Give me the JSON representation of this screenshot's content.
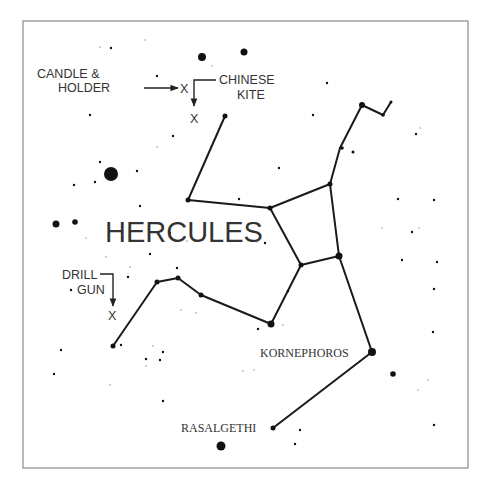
{
  "diagram": {
    "title": "HERCULES",
    "frame": {
      "x": 23,
      "y": 21,
      "w": 445,
      "h": 447
    },
    "colors": {
      "ink": "#111111",
      "label": "#333333",
      "frame": "#8a8a8a"
    },
    "labels": {
      "candle_line1": "CANDLE &",
      "candle_line2": "HOLDER",
      "chinese_line1": "CHINESE",
      "chinese_line2": "KITE",
      "drill_line1": "DRILL",
      "drill_line2": "GUN",
      "kornephoros": "KORNEPHOROS",
      "rasalgethi": "RASALGETHI",
      "marker": "X"
    },
    "named_stars": [
      {
        "name": "KORNEPHOROS",
        "x": 372,
        "y": 352,
        "r": 4
      },
      {
        "name": "RASALGETHI",
        "x": 273,
        "y": 428,
        "r": 2.5
      }
    ],
    "constellation_lines": [
      [
        [
          225,
          116
        ],
        [
          188,
          200
        ]
      ],
      [
        [
          188,
          200
        ],
        [
          270,
          208
        ]
      ],
      [
        [
          270,
          208
        ],
        [
          330,
          184
        ]
      ],
      [
        [
          330,
          184
        ],
        [
          340,
          148
        ]
      ],
      [
        [
          340,
          148
        ],
        [
          362,
          105
        ]
      ],
      [
        [
          362,
          105
        ],
        [
          383,
          115
        ]
      ],
      [
        [
          383,
          115
        ],
        [
          391,
          102
        ]
      ],
      [
        [
          270,
          208
        ],
        [
          301,
          265
        ]
      ],
      [
        [
          330,
          184
        ],
        [
          339,
          256
        ]
      ],
      [
        [
          301,
          265
        ],
        [
          339,
          256
        ]
      ],
      [
        [
          301,
          265
        ],
        [
          271,
          324
        ]
      ],
      [
        [
          271,
          324
        ],
        [
          201,
          295
        ]
      ],
      [
        [
          201,
          295
        ],
        [
          178,
          278
        ]
      ],
      [
        [
          178,
          278
        ],
        [
          157,
          282
        ]
      ],
      [
        [
          157,
          282
        ],
        [
          113,
          346
        ]
      ],
      [
        [
          339,
          256
        ],
        [
          372,
          352
        ]
      ],
      [
        [
          372,
          352
        ],
        [
          273,
          428
        ]
      ]
    ],
    "stars": [
      {
        "x": 225,
        "y": 116,
        "r": 2.5
      },
      {
        "x": 188,
        "y": 200,
        "r": 2.5
      },
      {
        "x": 270,
        "y": 208,
        "r": 2.5
      },
      {
        "x": 330,
        "y": 184,
        "r": 2.5
      },
      {
        "x": 342,
        "y": 148,
        "r": 1.8
      },
      {
        "x": 362,
        "y": 105,
        "r": 3
      },
      {
        "x": 383,
        "y": 115,
        "r": 1.8
      },
      {
        "x": 391,
        "y": 102,
        "r": 1.5
      },
      {
        "x": 301,
        "y": 265,
        "r": 2.5
      },
      {
        "x": 339,
        "y": 256,
        "r": 3.5
      },
      {
        "x": 271,
        "y": 324,
        "r": 3.5
      },
      {
        "x": 201,
        "y": 295,
        "r": 2.5
      },
      {
        "x": 178,
        "y": 278,
        "r": 2.5
      },
      {
        "x": 157,
        "y": 282,
        "r": 2.5
      },
      {
        "x": 113,
        "y": 346,
        "r": 2.5
      },
      {
        "x": 202,
        "y": 57,
        "r": 4
      },
      {
        "x": 244,
        "y": 52,
        "r": 3.5
      },
      {
        "x": 111,
        "y": 174,
        "r": 7
      },
      {
        "x": 56,
        "y": 224,
        "r": 3.5
      },
      {
        "x": 75,
        "y": 222,
        "r": 2.8
      },
      {
        "x": 222,
        "y": 492,
        "r": 0
      },
      {
        "x": 221,
        "y": 446,
        "r": 4.5
      },
      {
        "x": 393,
        "y": 374,
        "r": 2.8
      },
      {
        "x": 111,
        "y": 48,
        "r": 1.2
      },
      {
        "x": 157,
        "y": 76,
        "r": 1.2
      },
      {
        "x": 90,
        "y": 115,
        "r": 1.2
      },
      {
        "x": 173,
        "y": 136,
        "r": 1.2
      },
      {
        "x": 100,
        "y": 162,
        "r": 1.2
      },
      {
        "x": 95,
        "y": 182,
        "r": 1.2
      },
      {
        "x": 74,
        "y": 185,
        "r": 1.2
      },
      {
        "x": 137,
        "y": 171,
        "r": 1.2
      },
      {
        "x": 140,
        "y": 206,
        "r": 1.2
      },
      {
        "x": 150,
        "y": 254,
        "r": 1.2
      },
      {
        "x": 128,
        "y": 277,
        "r": 1.2
      },
      {
        "x": 71,
        "y": 290,
        "r": 1.2
      },
      {
        "x": 177,
        "y": 268,
        "r": 1.2
      },
      {
        "x": 121,
        "y": 345,
        "r": 1.2
      },
      {
        "x": 61,
        "y": 350,
        "r": 1.2
      },
      {
        "x": 54,
        "y": 374,
        "r": 1.2
      },
      {
        "x": 146,
        "y": 359,
        "r": 1.2
      },
      {
        "x": 163,
        "y": 352,
        "r": 1.2
      },
      {
        "x": 160,
        "y": 360,
        "r": 1.2
      },
      {
        "x": 163,
        "y": 401,
        "r": 1.2
      },
      {
        "x": 327,
        "y": 83,
        "r": 1.2
      },
      {
        "x": 313,
        "y": 115,
        "r": 1.2
      },
      {
        "x": 353,
        "y": 152,
        "r": 1.5
      },
      {
        "x": 416,
        "y": 134,
        "r": 1.2
      },
      {
        "x": 279,
        "y": 168,
        "r": 1.2
      },
      {
        "x": 398,
        "y": 199,
        "r": 1.2
      },
      {
        "x": 434,
        "y": 200,
        "r": 1.2
      },
      {
        "x": 265,
        "y": 243,
        "r": 1.2
      },
      {
        "x": 412,
        "y": 232,
        "r": 1.2
      },
      {
        "x": 402,
        "y": 260,
        "r": 1.2
      },
      {
        "x": 437,
        "y": 262,
        "r": 1.2
      },
      {
        "x": 434,
        "y": 289,
        "r": 1.2
      },
      {
        "x": 433,
        "y": 332,
        "r": 1.2
      },
      {
        "x": 258,
        "y": 329,
        "r": 1.2
      },
      {
        "x": 434,
        "y": 425,
        "r": 1.2
      },
      {
        "x": 300,
        "y": 430,
        "r": 1.2
      },
      {
        "x": 295,
        "y": 444,
        "r": 1.2
      },
      {
        "x": 239,
        "y": 199,
        "r": 1.2
      },
      {
        "x": 288,
        "y": 291,
        "r": 1.2
      },
      {
        "x": 170,
        "y": 233,
        "r": 1.2
      }
    ],
    "faint_stars": [
      {
        "x": 100,
        "y": 47
      },
      {
        "x": 145,
        "y": 40
      },
      {
        "x": 212,
        "y": 66
      },
      {
        "x": 157,
        "y": 147
      },
      {
        "x": 420,
        "y": 128
      },
      {
        "x": 382,
        "y": 228
      },
      {
        "x": 419,
        "y": 228
      },
      {
        "x": 86,
        "y": 238
      },
      {
        "x": 106,
        "y": 257
      },
      {
        "x": 130,
        "y": 267
      },
      {
        "x": 187,
        "y": 241
      },
      {
        "x": 181,
        "y": 310
      },
      {
        "x": 196,
        "y": 313
      },
      {
        "x": 153,
        "y": 346
      },
      {
        "x": 146,
        "y": 366
      },
      {
        "x": 110,
        "y": 385
      },
      {
        "x": 283,
        "y": 325
      },
      {
        "x": 257,
        "y": 242
      },
      {
        "x": 254,
        "y": 370
      },
      {
        "x": 243,
        "y": 371
      },
      {
        "x": 428,
        "y": 380
      },
      {
        "x": 418,
        "y": 390
      }
    ]
  }
}
